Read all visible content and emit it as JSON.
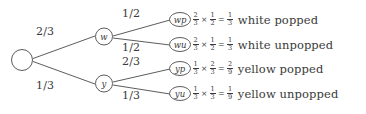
{
  "diagram": {
    "type": "probability-tree",
    "root": {
      "label": ""
    },
    "level1": [
      {
        "id": "w",
        "label": "w",
        "edge_probability": "2/3"
      },
      {
        "id": "y",
        "label": "y",
        "edge_probability": "1/3"
      }
    ],
    "level2_edges": [
      {
        "from": "w",
        "to": "wp",
        "probability": "1/2"
      },
      {
        "from": "w",
        "to": "wu",
        "probability": "1/2"
      },
      {
        "from": "y",
        "to": "yp",
        "probability": "2/3"
      },
      {
        "from": "y",
        "to": "yu",
        "probability": "1/3"
      }
    ],
    "outcomes": [
      {
        "node_label": "wp",
        "factor1": {
          "num": "2",
          "den": "3"
        },
        "times": "×",
        "factor2": {
          "num": "1",
          "den": "2"
        },
        "equals": "=",
        "result": {
          "num": "1",
          "den": "3"
        },
        "description": "white popped"
      },
      {
        "node_label": "wu",
        "factor1": {
          "num": "2",
          "den": "3"
        },
        "times": "×",
        "factor2": {
          "num": "1",
          "den": "2"
        },
        "equals": "=",
        "result": {
          "num": "1",
          "den": "3"
        },
        "description": "white unpopped"
      },
      {
        "node_label": "yp",
        "factor1": {
          "num": "1",
          "den": "3"
        },
        "times": "×",
        "factor2": {
          "num": "2",
          "den": "3"
        },
        "equals": "=",
        "result": {
          "num": "2",
          "den": "9"
        },
        "description": "yellow popped"
      },
      {
        "node_label": "yu",
        "factor1": {
          "num": "1",
          "den": "3"
        },
        "times": "×",
        "factor2": {
          "num": "1",
          "den": "3"
        },
        "equals": "=",
        "result": {
          "num": "1",
          "den": "9"
        },
        "description": "yellow unpopped"
      }
    ],
    "colors": {
      "stroke": "#4a4a4a",
      "text": "#3a3a3a",
      "background": "#ffffff"
    }
  }
}
